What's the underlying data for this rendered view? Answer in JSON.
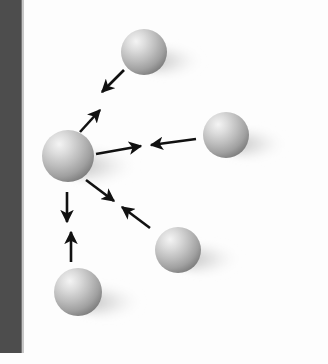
{
  "figure": {
    "kind": "physics-diagram",
    "title": "Gravitational attraction between masses",
    "caption": "",
    "width": 328,
    "height": 364,
    "background_color": "#fdfdfd",
    "scan_artifact": {
      "name": "scan-edge-bar",
      "color": "#4d4d4d",
      "x": 0,
      "y": 0,
      "width": 22,
      "height": 353,
      "visible": true
    }
  },
  "palette": {
    "sphere_highlight": "#f2f2f2",
    "sphere_mid": "#b8b8b8",
    "sphere_shade": "#8a8a8a",
    "sphere_edge": "#6f6f6f",
    "shadow": "#bdbdbd",
    "arrow": "#111111",
    "background": "#fdfdfd",
    "bar": "#4d4d4d"
  },
  "lighting": {
    "highlight_direction": "upper-left",
    "shadow_direction": "right-and-down"
  },
  "spheres": [
    {
      "id": "sphere-top",
      "label": "top sphere",
      "cx": 144,
      "cy": 52,
      "r": 23,
      "shadow_length": 58,
      "shadow_drop": 9
    },
    {
      "id": "sphere-center",
      "label": "center sphere",
      "cx": 68,
      "cy": 156,
      "r": 26,
      "shadow_length": 68,
      "shadow_drop": 10
    },
    {
      "id": "sphere-right",
      "label": "right sphere",
      "cx": 226,
      "cy": 135,
      "r": 23,
      "shadow_length": 60,
      "shadow_drop": 9
    },
    {
      "id": "sphere-lower-right",
      "label": "lower right sphere",
      "cx": 178,
      "cy": 250,
      "r": 23,
      "shadow_length": 62,
      "shadow_drop": 9
    },
    {
      "id": "sphere-bottom",
      "label": "bottom sphere",
      "cx": 78,
      "cy": 292,
      "r": 24,
      "shadow_length": 64,
      "shadow_drop": 10
    }
  ],
  "force_pairs": [
    {
      "id": "pair-top",
      "label": "attraction between center and top sphere",
      "between": [
        "sphere-center",
        "sphere-top"
      ],
      "arrows": [
        {
          "id": "arrow-top-inward",
          "x1": 124,
          "y1": 70,
          "x2": 102,
          "y2": 92,
          "direction": "toward-center"
        },
        {
          "id": "arrow-center-to-top",
          "x1": 80,
          "y1": 132,
          "x2": 100,
          "y2": 110,
          "direction": "toward-top"
        }
      ]
    },
    {
      "id": "pair-right",
      "label": "attraction between center and right sphere",
      "between": [
        "sphere-center",
        "sphere-right"
      ],
      "arrows": [
        {
          "id": "arrow-center-to-right",
          "x1": 96,
          "y1": 154,
          "x2": 141,
          "y2": 146,
          "direction": "toward-right"
        },
        {
          "id": "arrow-right-inward",
          "x1": 196,
          "y1": 139,
          "x2": 151,
          "y2": 145,
          "direction": "toward-center"
        }
      ]
    },
    {
      "id": "pair-lower-right",
      "label": "attraction between center and lower right sphere",
      "between": [
        "sphere-center",
        "sphere-lower-right"
      ],
      "arrows": [
        {
          "id": "arrow-center-to-lower-right",
          "x1": 86,
          "y1": 180,
          "x2": 114,
          "y2": 201,
          "direction": "toward-lower-right"
        },
        {
          "id": "arrow-lower-right-inward",
          "x1": 150,
          "y1": 228,
          "x2": 122,
          "y2": 207,
          "direction": "toward-center"
        }
      ]
    },
    {
      "id": "pair-bottom",
      "label": "attraction between center and bottom sphere",
      "between": [
        "sphere-center",
        "sphere-bottom"
      ],
      "arrows": [
        {
          "id": "arrow-center-to-bottom",
          "x1": 67,
          "y1": 192,
          "x2": 67,
          "y2": 222,
          "direction": "toward-bottom"
        },
        {
          "id": "arrow-bottom-inward",
          "x1": 71,
          "y1": 262,
          "x2": 71,
          "y2": 232,
          "direction": "toward-center"
        }
      ]
    }
  ]
}
